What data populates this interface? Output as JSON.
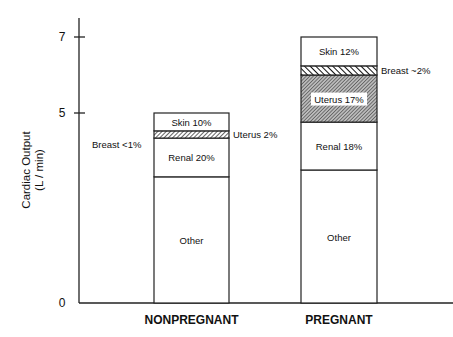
{
  "chart_data": {
    "type": "bar",
    "stacked": true,
    "title": "",
    "xlabel": "",
    "ylabel": "Cardiac Output",
    "ylabel_unit": "(L / min)",
    "ylim": [
      0,
      7.4
    ],
    "yticks": [
      0,
      5,
      7
    ],
    "categories": [
      "NONPREGNANT",
      "PREGNANT"
    ],
    "bars": [
      {
        "category": "NONPREGNANT",
        "total": 5,
        "segments": [
          {
            "name": "Other",
            "label": "Other",
            "from": 0,
            "to": 3.32,
            "pattern": "none"
          },
          {
            "name": "Renal",
            "label": "Renal  20%",
            "from": 3.32,
            "to": 4.34,
            "pattern": "none"
          },
          {
            "name": "Uterus",
            "label": "Uterus 2%",
            "from": 4.34,
            "to": 4.53,
            "pattern": "hatch",
            "label_position": "right"
          },
          {
            "name": "Breast",
            "label": "Breast <1%",
            "from": 4.53,
            "to": 4.53,
            "pattern": "none",
            "label_position": "left"
          },
          {
            "name": "Skin",
            "label": "Skin  10%",
            "from": 4.53,
            "to": 5,
            "pattern": "none"
          }
        ]
      },
      {
        "category": "PREGNANT",
        "total": 7,
        "segments": [
          {
            "name": "Other",
            "label": "Other",
            "from": 0,
            "to": 3.5,
            "pattern": "none"
          },
          {
            "name": "Renal",
            "label": "Renal  18%",
            "from": 3.5,
            "to": 4.76,
            "pattern": "none"
          },
          {
            "name": "Uterus",
            "label": "Uterus 17%",
            "from": 4.76,
            "to": 6.0,
            "pattern": "hatch-dense"
          },
          {
            "name": "Breast",
            "label": "Breast ~2%",
            "from": 6.0,
            "to": 6.24,
            "pattern": "hatch-bold",
            "label_position": "right"
          },
          {
            "name": "Skin",
            "label": "Skin  12%",
            "from": 6.24,
            "to": 7,
            "pattern": "none"
          }
        ]
      }
    ],
    "grid": false,
    "legend": "none"
  }
}
